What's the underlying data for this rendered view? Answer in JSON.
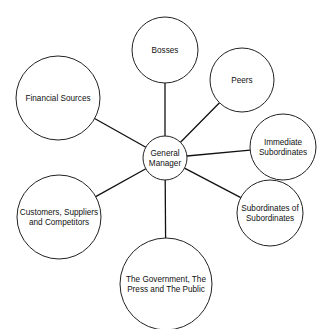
{
  "diagram": {
    "type": "hub-and-spoke",
    "center": {
      "id": "general-manager",
      "lines": [
        "General",
        "Manager"
      ],
      "cx": 165,
      "cy": 158,
      "r": 22
    },
    "nodes": [
      {
        "id": "bosses",
        "lines": [
          "Bosses"
        ],
        "cx": 165,
        "cy": 50,
        "r": 33
      },
      {
        "id": "peers",
        "lines": [
          "Peers"
        ],
        "cx": 242,
        "cy": 80,
        "r": 32
      },
      {
        "id": "immediate-subordinates",
        "lines": [
          "Immediate",
          "Subordinates"
        ],
        "cx": 283,
        "cy": 147,
        "r": 33
      },
      {
        "id": "subordinates-of-subordinates",
        "lines": [
          "Subordinates of",
          "Subordinates"
        ],
        "cx": 270,
        "cy": 213,
        "r": 33
      },
      {
        "id": "government-press-public",
        "lines": [
          "The Government, The",
          "Press and The Public"
        ],
        "cx": 166,
        "cy": 284,
        "r": 46
      },
      {
        "id": "customers-suppliers-competitors",
        "lines": [
          "Customers, Suppliers",
          "and Competitors"
        ],
        "cx": 59,
        "cy": 217,
        "r": 42
      },
      {
        "id": "financial-sources",
        "lines": [
          "Financial Sources"
        ],
        "cx": 58,
        "cy": 98,
        "r": 42
      }
    ],
    "colors": {
      "background": "#ffffff",
      "stroke": "#222222",
      "text": "#111111"
    }
  }
}
